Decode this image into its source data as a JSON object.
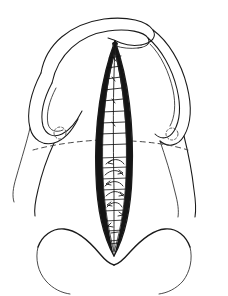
{
  "figure": {
    "domain_note": "anatomical line drawing",
    "caption": "",
    "canvas": {
      "width": 228,
      "height": 296,
      "background": "#ffffff"
    }
  },
  "colors": {
    "ink": "#1a1a1a",
    "ink_soft": "#2b2b2b",
    "dash": "#4a4a4a",
    "rim_shading": "#151515",
    "paper": "#ffffff"
  },
  "structures": [
    {
      "id": "upper-hood",
      "label": "upper arched hood fold",
      "side": "midline-superior"
    },
    {
      "id": "labium-left",
      "label": "left labial fold",
      "side": "left"
    },
    {
      "id": "labium-right",
      "label": "right labial fold",
      "side": "right"
    },
    {
      "id": "lens-wound",
      "label": "fusiform midline wound",
      "side": "midline"
    },
    {
      "id": "lower-lobes",
      "label": "lower double lobe contour",
      "side": "inferior"
    },
    {
      "id": "reference-line",
      "label": "dashed transverse reference line",
      "side": "transverse"
    },
    {
      "id": "marker-left",
      "label": "left dashed circular marker",
      "side": "left"
    },
    {
      "id": "marker-right",
      "label": "right dashed circular marker",
      "side": "right"
    }
  ],
  "annotations": {
    "suture_count_upper": 11,
    "suture_count_lower": 9,
    "rung_count": 9,
    "marker_radius_px": 6,
    "reference_line_y_px": 146
  },
  "legend": {
    "visible": false,
    "entries": []
  }
}
